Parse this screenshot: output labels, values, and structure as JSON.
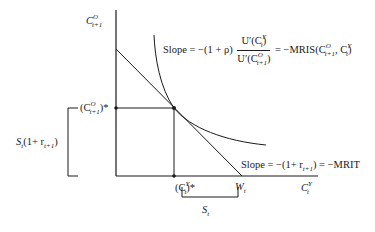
{
  "diagram": {
    "type": "intertemporal-consumption-choice",
    "axes": {
      "y_label": {
        "base": "C",
        "sup": "O",
        "sub": "t+1"
      },
      "x_label": {
        "base": "C",
        "sup": "Y",
        "sub": "t"
      }
    },
    "points": {
      "optimal_old": {
        "text": "(C",
        "sup": "O",
        "sub": "t+1",
        "suffix": ")*"
      },
      "optimal_young": {
        "text": "(C",
        "sup": "Y",
        "sub": "t",
        "suffix": ")*"
      },
      "wealth": {
        "base": "W",
        "sub": "t"
      }
    },
    "brackets": {
      "left": {
        "text": "S",
        "sub": "t",
        "rest": "(1+ r",
        "rest_sub": "t+1",
        "close": ")"
      },
      "bottom": {
        "base": "S",
        "sub": "t"
      }
    },
    "annotations": {
      "indifference_slope": {
        "prefix": "Slope = −(1 + ρ)",
        "numerator": "U′(C",
        "num_sup": "Y",
        "num_sub": "t",
        "denominator": "U′(C",
        "den_sup": "O",
        "den_sub": "t+1",
        "suffix": "= −MRIS(C",
        "suffix_sup1": "O",
        "suffix_sub1": "t+1",
        "suffix_mid": ", C",
        "suffix_sup2": "Y",
        "suffix_sub2": "t",
        "suffix_end": ")"
      },
      "budget_slope": {
        "prefix": "Slope = −(1+ r",
        "sub": "t+1",
        "suffix": ") = −MRIT"
      }
    },
    "colors": {
      "line": "#1a1a1a",
      "background": "#ffffff"
    }
  }
}
